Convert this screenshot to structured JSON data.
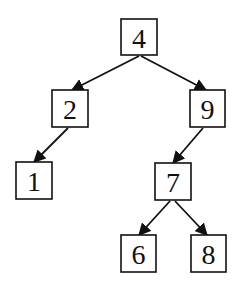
{
  "diagram": {
    "type": "binary-search-tree",
    "nodes": [
      {
        "id": "n4",
        "label": "4",
        "x": 121,
        "y": 19,
        "w": 36,
        "h": 36
      },
      {
        "id": "n2",
        "label": "2",
        "x": 52,
        "y": 90,
        "w": 36,
        "h": 37
      },
      {
        "id": "n9",
        "label": "9",
        "x": 190,
        "y": 90,
        "w": 35,
        "h": 37
      },
      {
        "id": "n1",
        "label": "1",
        "x": 16,
        "y": 162,
        "w": 36,
        "h": 37
      },
      {
        "id": "n7",
        "label": "7",
        "x": 155,
        "y": 163,
        "w": 36,
        "h": 37
      },
      {
        "id": "n6",
        "label": "6",
        "x": 121,
        "y": 235,
        "w": 35,
        "h": 37
      },
      {
        "id": "n8",
        "label": "8",
        "x": 191,
        "y": 235,
        "w": 35,
        "h": 37
      }
    ],
    "edges": [
      {
        "from": "4",
        "to": "2",
        "x1": 139,
        "y1": 56,
        "x2": 72,
        "y2": 90
      },
      {
        "from": "4",
        "to": "9",
        "x1": 141,
        "y1": 56,
        "x2": 206,
        "y2": 90
      },
      {
        "from": "2",
        "to": "1",
        "x1": 68,
        "y1": 128,
        "x2": 34,
        "y2": 162
      },
      {
        "from": "9",
        "to": "7",
        "x1": 203,
        "y1": 128,
        "x2": 173,
        "y2": 163
      },
      {
        "from": "7",
        "to": "6",
        "x1": 170,
        "y1": 201,
        "x2": 139,
        "y2": 235
      },
      {
        "from": "7",
        "to": "8",
        "x1": 175,
        "y1": 201,
        "x2": 207,
        "y2": 235
      }
    ]
  }
}
